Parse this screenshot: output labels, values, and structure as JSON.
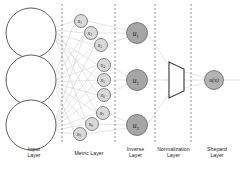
{
  "diagram": {
    "background_color": "#ffffff",
    "line_color": "#bdbdbd",
    "stroke_color": "#4d4d4d",
    "node_fill_light": "#ffffff",
    "node_fill_metric": "#d9d9d9",
    "node_fill_inverse": "#a6a6a6",
    "node_fill_shepard": "#b3b3b3",
    "divider_color": "#666666"
  },
  "captions": [
    {
      "id": "input",
      "text": "Input\nLayer",
      "x": 8,
      "y": 146,
      "width": 52
    },
    {
      "id": "metric",
      "text": "Metric Layer",
      "x": 63,
      "y": 150,
      "width": 52
    },
    {
      "id": "inverse",
      "text": "Inverse\nLayer",
      "x": 117,
      "y": 146,
      "width": 37
    },
    {
      "id": "normalization",
      "text": "Normalization\nLayer",
      "x": 155,
      "y": 146,
      "width": 37
    },
    {
      "id": "shepard",
      "text": "Shepard\nLayer",
      "x": 194,
      "y": 146,
      "width": 46
    }
  ],
  "dividers": [
    {
      "id": "divider-1",
      "x": 62
    },
    {
      "id": "divider-2",
      "x": 115
    },
    {
      "id": "divider-3",
      "x": 155
    },
    {
      "id": "divider-4",
      "x": 191
    }
  ],
  "input_nodes": [
    {
      "id": "input-1",
      "label": "",
      "cx": 31,
      "cy": 33,
      "r": 25
    },
    {
      "id": "input-2",
      "label": "",
      "cx": 31,
      "cy": 80,
      "r": 25
    },
    {
      "id": "input-3",
      "label": "",
      "cx": 31,
      "cy": 125,
      "r": 25
    }
  ],
  "metric_nodes": [
    {
      "id": "metric-1",
      "label": "x",
      "sub": "1",
      "cx": 81,
      "cy": 21,
      "r": 6.5
    },
    {
      "id": "metric-2",
      "label": "x",
      "sub": "2",
      "cx": 91,
      "cy": 33,
      "r": 6.5
    },
    {
      "id": "metric-3",
      "label": "x",
      "sub": "3",
      "cx": 101,
      "cy": 45,
      "r": 6.5
    },
    {
      "id": "metric-4",
      "label": "x",
      "sub": "4",
      "cx": 104,
      "cy": 65,
      "r": 6.5
    },
    {
      "id": "metric-5",
      "label": "x",
      "sub": "5",
      "cx": 104,
      "cy": 80,
      "r": 6.5
    },
    {
      "id": "metric-6",
      "label": "x",
      "sub": "6",
      "cx": 104,
      "cy": 95,
      "r": 6.5
    },
    {
      "id": "metric-7",
      "label": "x",
      "sub": "7",
      "cx": 103,
      "cy": 113,
      "r": 6.5
    },
    {
      "id": "metric-8",
      "label": "x",
      "sub": "8",
      "cx": 92,
      "cy": 124,
      "r": 6.5
    },
    {
      "id": "metric-9",
      "label": "x",
      "sub": "9",
      "cx": 80,
      "cy": 134,
      "r": 6.5
    }
  ],
  "inverse_nodes": [
    {
      "id": "inverse-1",
      "label": "u",
      "sub": "1",
      "cx": 137,
      "cy": 33,
      "r": 10.5
    },
    {
      "id": "inverse-2",
      "label": "u",
      "sub": "2",
      "cx": 137,
      "cy": 80,
      "r": 10.5
    },
    {
      "id": "inverse-3",
      "label": "u",
      "sub": "3",
      "cx": 137,
      "cy": 125,
      "r": 10.5
    }
  ],
  "normalization_shape": {
    "id": "normalization-trapezoid",
    "points": "169,62 169,98 184,91 184,69",
    "label": ""
  },
  "shepard_node": {
    "id": "shepard-output",
    "label": "u(x)",
    "cx": 214,
    "cy": 80,
    "r": 9.5
  },
  "output_arrow": {
    "id": "output-arrow",
    "from_x": 224,
    "to_x": 240,
    "y": 80
  }
}
